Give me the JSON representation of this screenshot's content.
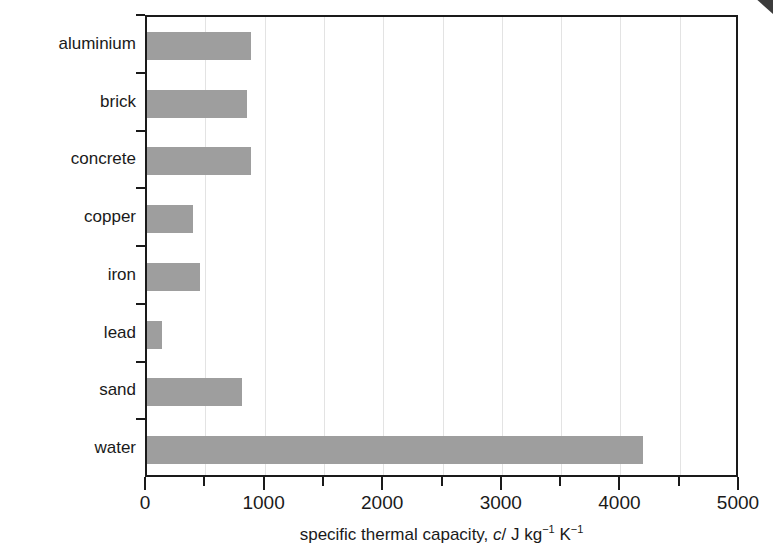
{
  "chart_data": {
    "type": "bar",
    "orientation": "horizontal",
    "title": "",
    "subtitle": "",
    "xlabel": "specific thermal capacity, c/ J kg⁻¹ K⁻¹",
    "ylabel": "",
    "categories": [
      "aluminium",
      "brick",
      "concrete",
      "copper",
      "iron",
      "lead",
      "sand",
      "water"
    ],
    "values": [
      880,
      840,
      880,
      390,
      450,
      130,
      800,
      4180
    ],
    "xlim": [
      0,
      5000
    ],
    "xticks": [
      0,
      1000,
      2000,
      3000,
      4000,
      5000
    ],
    "xticklabels": [
      "0",
      "1000",
      "2000",
      "3000",
      "4000",
      "5000"
    ],
    "xminorticks": [
      500,
      1500,
      2500,
      3500,
      4500
    ],
    "gridlines": [
      500,
      1000,
      1500,
      2000,
      2500,
      3000,
      3500,
      4000,
      4500
    ],
    "grid": true,
    "legend": false,
    "legend_position": "none",
    "bar_color": "#9e9e9e",
    "axis_color": "#1a1a1a",
    "grid_color": "#e3e3e3",
    "background": "#ffffff"
  },
  "axis_title_parts": {
    "lead": "specific thermal capacity, ",
    "symbol": "c",
    "slash": "/ J kg",
    "exp1": "−1",
    "kelvin": " K",
    "exp2": "−1"
  }
}
